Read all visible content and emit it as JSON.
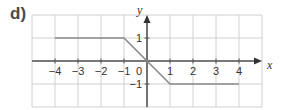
{
  "part_label": "d)",
  "chart_data": {
    "type": "line",
    "title": "",
    "xlabel": "x",
    "ylabel": "y",
    "xlim": [
      -5,
      5
    ],
    "ylim": [
      -2,
      2
    ],
    "grid": true,
    "x_ticks": [
      -4,
      -3,
      -2,
      -1,
      0,
      1,
      2,
      3,
      4
    ],
    "x_tick_labels": [
      "−4",
      "−3",
      "−2",
      "−1",
      "0",
      "1",
      "2",
      "3",
      "4"
    ],
    "y_ticks": [
      1,
      -1
    ],
    "y_tick_labels": [
      "1",
      "−1"
    ],
    "series": [
      {
        "name": "piecewise",
        "x": [
          -4,
          -1,
          0,
          1,
          4
        ],
        "y": [
          1,
          1,
          0,
          -1,
          -1
        ]
      }
    ],
    "colors": {
      "line": "#8a8a8a",
      "axis": "#555555",
      "grid": "#d0d0d0"
    }
  }
}
